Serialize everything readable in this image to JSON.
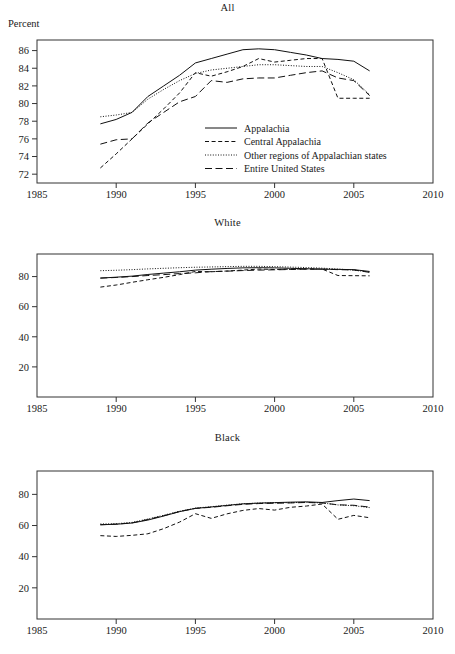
{
  "figure": {
    "y_axis_label": "Percent",
    "width": 455,
    "height": 654
  },
  "legend": {
    "position": "inside-panel-1-lower-right",
    "entries": [
      {
        "label": "Appalachia",
        "dash": "none"
      },
      {
        "label": "Central Appalachia",
        "dash": "short"
      },
      {
        "label": "Other regions of Appalachian states",
        "dash": "dotted"
      },
      {
        "label": "Entire United States",
        "dash": "long"
      }
    ]
  },
  "chart_data": [
    {
      "type": "line",
      "title": "All",
      "xlabel": "",
      "ylabel": "Percent",
      "xlim": [
        1985,
        2010
      ],
      "ylim": [
        71,
        87.2
      ],
      "xticks": [
        1985,
        1990,
        1995,
        2000,
        2005,
        2010
      ],
      "yticks": [
        72,
        74,
        76,
        78,
        80,
        82,
        84,
        86
      ],
      "grid": false,
      "x": [
        1989,
        1990,
        1991,
        1992,
        1993,
        1994,
        1995,
        1996,
        1997,
        1998,
        1999,
        2000,
        2001,
        2002,
        2003,
        2004,
        2005,
        2006
      ],
      "series": [
        {
          "name": "Appalachia",
          "dash": "none",
          "values": [
            77.7,
            78.2,
            79.0,
            80.8,
            82.0,
            83.2,
            84.6,
            85.1,
            85.6,
            86.1,
            86.2,
            86.1,
            85.8,
            85.5,
            85.1,
            85.0,
            84.8,
            83.7
          ]
        },
        {
          "name": "Central Appalachia",
          "dash": "short",
          "values": [
            72.7,
            74.3,
            76.0,
            77.7,
            79.4,
            81.2,
            83.5,
            83.1,
            83.6,
            84.2,
            85.1,
            84.7,
            84.9,
            85.1,
            85.1,
            80.6,
            80.6,
            80.6
          ]
        },
        {
          "name": "Other regions of Appalachian states",
          "dash": "dotted",
          "values": [
            78.5,
            78.7,
            79.0,
            80.5,
            81.6,
            82.6,
            83.4,
            83.8,
            84.0,
            84.2,
            84.4,
            84.4,
            84.3,
            84.2,
            84.2,
            83.5,
            82.7,
            81.0
          ]
        },
        {
          "name": "Entire United States",
          "dash": "long",
          "values": [
            75.4,
            75.9,
            76.0,
            77.8,
            79.0,
            80.2,
            80.8,
            82.6,
            82.4,
            82.8,
            82.9,
            82.9,
            83.2,
            83.5,
            83.7,
            82.9,
            82.6,
            80.9
          ]
        }
      ]
    },
    {
      "type": "line",
      "title": "White",
      "xlabel": "",
      "ylabel": "",
      "xlim": [
        1985,
        2010
      ],
      "ylim": [
        0,
        95
      ],
      "xticks": [
        1985,
        1990,
        1995,
        2000,
        2005,
        2010
      ],
      "yticks": [
        20,
        40,
        60,
        80
      ],
      "grid": false,
      "x": [
        1989,
        1990,
        1991,
        1992,
        1993,
        1994,
        1995,
        1996,
        1997,
        1998,
        1999,
        2000,
        2001,
        2002,
        2003,
        2004,
        2005,
        2006
      ],
      "series": [
        {
          "name": "Appalachia",
          "dash": "none",
          "values": [
            79.0,
            79.6,
            80.3,
            81.4,
            82.3,
            83.2,
            84.3,
            84.9,
            85.4,
            85.8,
            85.9,
            85.8,
            85.5,
            85.2,
            84.9,
            84.8,
            84.6,
            83.4
          ]
        },
        {
          "name": "Central Appalachia",
          "dash": "short",
          "values": [
            73.0,
            74.4,
            76.2,
            77.9,
            79.5,
            81.3,
            83.4,
            83.2,
            83.7,
            84.3,
            85.0,
            84.7,
            84.9,
            85.1,
            85.0,
            80.7,
            80.6,
            80.5
          ]
        },
        {
          "name": "Other regions of Appalachian states",
          "dash": "dotted",
          "values": [
            83.9,
            84.2,
            84.6,
            85.1,
            85.5,
            85.9,
            86.2,
            86.4,
            86.6,
            86.8,
            86.8,
            86.6,
            86.3,
            86.0,
            85.6,
            85.0,
            84.3,
            83.0
          ]
        },
        {
          "name": "Entire United States",
          "dash": "long",
          "values": [
            79.0,
            79.4,
            80.0,
            80.7,
            81.3,
            82.0,
            82.5,
            83.3,
            83.6,
            84.0,
            84.3,
            84.5,
            84.7,
            84.9,
            85.0,
            84.6,
            84.4,
            82.8
          ]
        }
      ]
    },
    {
      "type": "line",
      "title": "Black",
      "xlabel": "",
      "ylabel": "",
      "xlim": [
        1985,
        2010
      ],
      "ylim": [
        0,
        95
      ],
      "xticks": [
        1985,
        1990,
        1995,
        2000,
        2005,
        2010
      ],
      "yticks": [
        20,
        40,
        60,
        80
      ],
      "grid": false,
      "x": [
        1989,
        1990,
        1991,
        1992,
        1993,
        1994,
        1995,
        1996,
        1997,
        1998,
        1999,
        2000,
        2001,
        2002,
        2003,
        2004,
        2005,
        2006
      ],
      "series": [
        {
          "name": "Appalachia",
          "dash": "none",
          "values": [
            60.5,
            60.8,
            61.6,
            63.5,
            66.1,
            68.9,
            71.0,
            71.9,
            72.9,
            73.9,
            74.4,
            74.7,
            75.0,
            75.2,
            74.8,
            76.0,
            77.0,
            76.0
          ]
        },
        {
          "name": "Central Appalachia",
          "dash": "short",
          "values": [
            53.5,
            53.0,
            53.7,
            54.7,
            58.0,
            62.2,
            67.6,
            64.6,
            67.5,
            69.7,
            70.9,
            69.9,
            71.7,
            72.5,
            73.8,
            64.0,
            66.5,
            65.0
          ]
        },
        {
          "name": "Other regions of Appalachian states",
          "dash": "dotted",
          "values": [
            61.0,
            61.2,
            62.0,
            64.2,
            66.6,
            69.2,
            71.2,
            72.1,
            73.1,
            74.0,
            74.4,
            74.6,
            74.7,
            74.9,
            74.5,
            73.2,
            72.7,
            71.5
          ]
        },
        {
          "name": "Entire United States",
          "dash": "long",
          "values": [
            60.5,
            60.9,
            61.7,
            63.9,
            66.3,
            69.0,
            71.0,
            71.7,
            72.7,
            73.6,
            74.1,
            74.3,
            74.5,
            74.8,
            74.5,
            73.3,
            73.0,
            71.8
          ]
        }
      ]
    }
  ]
}
